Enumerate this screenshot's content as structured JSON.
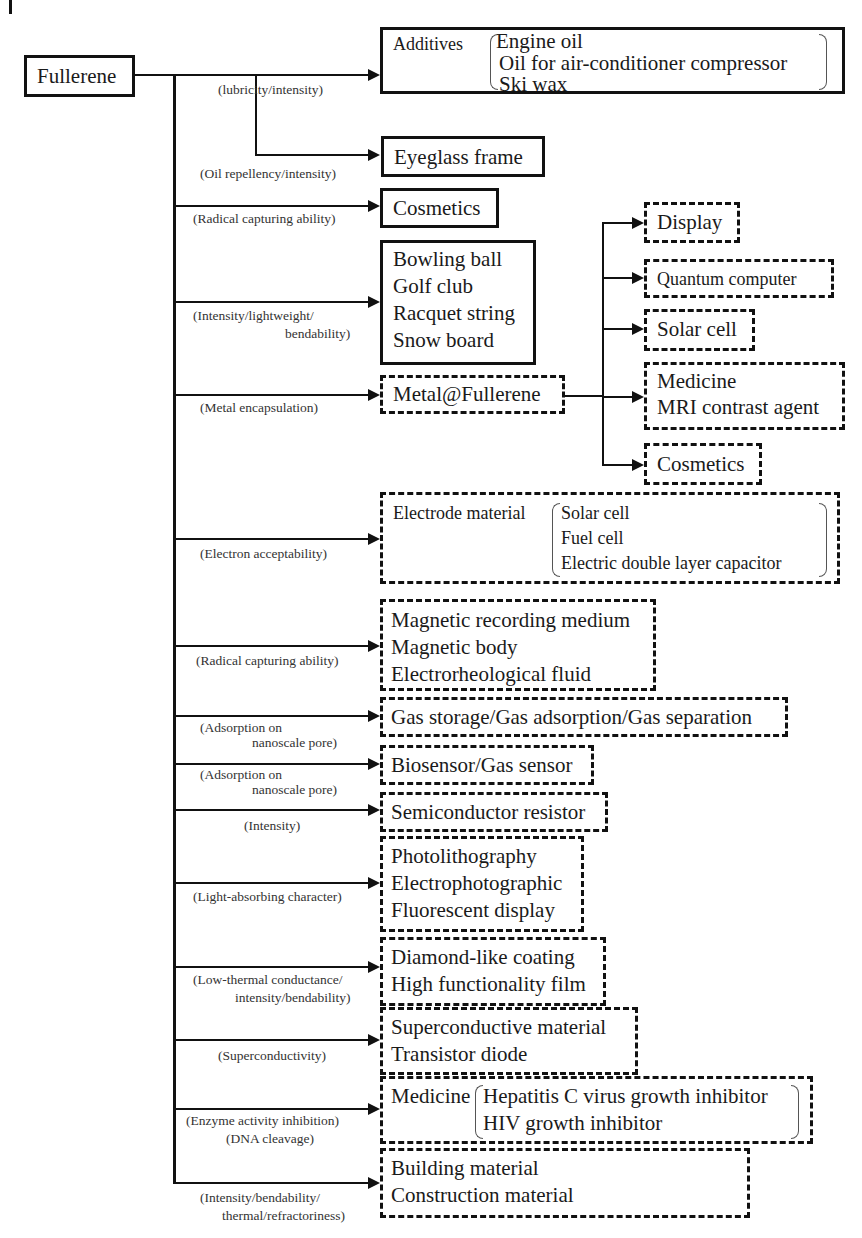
{
  "root": {
    "label": "Fullerene"
  },
  "branches": [
    {
      "property": "(lubricity/intensity)",
      "group_label": "Additives",
      "items": [
        "Engine oil",
        "Oil for air-conditioner compressor",
        "Ski wax"
      ]
    },
    {
      "property": "(Oil repellency/intensity)",
      "items": [
        "Eyeglass frame"
      ]
    },
    {
      "property": "(Radical capturing ability)",
      "items": [
        "Cosmetics"
      ]
    },
    {
      "property_lines": [
        "(Intensity/lightweight/",
        "bendability)"
      ],
      "items": [
        "Bowling ball",
        "Golf club",
        "Racquet string",
        "Snow board"
      ]
    },
    {
      "property": "(Metal encapsulation)",
      "items": [
        "Metal@Fullerene"
      ],
      "sub_items": [
        {
          "items": [
            "Display"
          ]
        },
        {
          "items": [
            "Quantum computer"
          ]
        },
        {
          "items": [
            "Solar cell"
          ]
        },
        {
          "items": [
            "Medicine",
            "MRI contrast agent"
          ]
        },
        {
          "items": [
            "Cosmetics"
          ]
        }
      ]
    },
    {
      "property": "(Electron acceptability)",
      "group_label": "Electrode material",
      "items": [
        "Solar cell",
        "Fuel cell",
        "Electric double layer capacitor"
      ]
    },
    {
      "property": "(Radical capturing ability)",
      "items": [
        "Magnetic recording medium",
        "Magnetic body",
        "Electrorheological fluid"
      ]
    },
    {
      "property_lines": [
        "(Adsorption on",
        "nanoscale pore)"
      ],
      "items": [
        "Gas storage/Gas adsorption/Gas separation"
      ]
    },
    {
      "property_lines": [
        "(Adsorption on",
        "nanoscale pore)"
      ],
      "items": [
        "Biosensor/Gas sensor"
      ]
    },
    {
      "property": "(Intensity)",
      "items": [
        "Semiconductor resistor"
      ]
    },
    {
      "property": "(Light-absorbing character)",
      "items": [
        "Photolithography",
        "Electrophotographic",
        "Fluorescent display"
      ]
    },
    {
      "property_lines": [
        "(Low-thermal conductance/",
        "intensity/bendability)"
      ],
      "items": [
        "Diamond-like coating",
        "High functionality film"
      ]
    },
    {
      "property": "(Superconductivity)",
      "items": [
        "Superconductive material",
        "Transistor diode"
      ]
    },
    {
      "property_lines": [
        "(Enzyme activity inhibition)",
        "(DNA cleavage)"
      ],
      "group_label": "Medicine",
      "items": [
        "Hepatitis C virus growth inhibitor",
        "HIV growth inhibitor"
      ]
    },
    {
      "property_lines": [
        "(Intensity/bendability/",
        "thermal/refractoriness)"
      ],
      "items": [
        "Building material",
        "Construction material"
      ]
    }
  ],
  "legend": {
    "solid_box": "current use",
    "dashed_box": "future use"
  },
  "colors": {
    "line": "#111111",
    "text": "#1a1a1a",
    "label": "#333333"
  }
}
